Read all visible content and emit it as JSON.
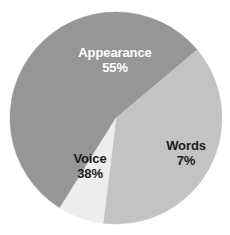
{
  "chart_data": {
    "type": "pie",
    "title": "",
    "subtitle": "",
    "xlabel": "",
    "ylabel": "",
    "legend": "none",
    "grid": false,
    "labels_inside_slices": true,
    "background_color": "#ffffff",
    "center": {
      "x": 116,
      "y": 118
    },
    "radius": 106,
    "categories": [
      "Appearance",
      "Voice",
      "Words"
    ],
    "values": [
      55,
      38,
      7
    ],
    "value_unit": "%",
    "colors": [
      "#969696",
      "#c3c3c3",
      "#ededed"
    ],
    "slices": [
      {
        "name": "Appearance",
        "value": 55,
        "value_label": "55%",
        "color": "#969696",
        "label_color": "#ffffff",
        "start_angle_deg": 122,
        "sweep_angle_deg": 198
      },
      {
        "name": "Voice",
        "value": 38,
        "value_label": "38%",
        "color": "#c3c3c3",
        "label_color": "#1a1a1a",
        "start_angle_deg": 320,
        "sweep_angle_deg": 137
      },
      {
        "name": "Words",
        "value": 7,
        "value_label": "7%",
        "color": "#ededed",
        "label_color": "#1a1a1a",
        "start_angle_deg": 97,
        "sweep_angle_deg": 25
      }
    ]
  },
  "labels": {
    "appearance": {
      "name": "Appearance",
      "value": "55%"
    },
    "voice": {
      "name": "Voice",
      "value": "38%"
    },
    "words": {
      "name": "Words",
      "value": "7%"
    }
  }
}
